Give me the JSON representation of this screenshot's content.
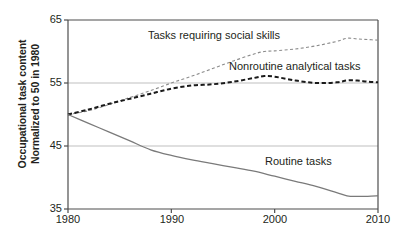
{
  "chart_data": {
    "type": "line",
    "title": "",
    "xlabel": "",
    "ylabel": "Occupational task content Normalized to 50 in 1980",
    "ylabel_lines": [
      "Occupational task content",
      "Normalized to 50 in 1980"
    ],
    "xlim": [
      1980,
      2010
    ],
    "ylim": [
      35,
      65
    ],
    "xticks": [
      1980,
      1990,
      2000,
      2010
    ],
    "xtick_labels": [
      "1980",
      "1990",
      "2000",
      "2010"
    ],
    "yticks": [
      35,
      45,
      55,
      65
    ],
    "ytick_labels": [
      "35",
      "45",
      "55",
      "65"
    ],
    "grid": "horizontal",
    "legend_position": "inline-annotations",
    "series": [
      {
        "name": "Tasks requiring social skills",
        "label": "Tasks requiring social skills",
        "style": "dashed",
        "color": "#8c8c8c",
        "x": [
          1980,
          1982,
          1984,
          1986,
          1988,
          1990,
          1992,
          1994,
          1996,
          1998,
          1999,
          2000,
          2002,
          2004,
          2006,
          2007,
          2008,
          2009,
          2010
        ],
        "values": [
          50.0,
          50.6,
          51.6,
          52.7,
          53.8,
          55.0,
          56.1,
          57.3,
          58.5,
          59.6,
          60.0,
          60.1,
          60.4,
          60.9,
          61.6,
          62.1,
          62.0,
          61.9,
          61.8
        ]
      },
      {
        "name": "Nonroutine analytical tasks",
        "label": "Nonroutine analytical tasks",
        "style": "dashed-bold",
        "color": "#1a1a1a",
        "x": [
          1980,
          1982,
          1984,
          1986,
          1988,
          1990,
          1992,
          1994,
          1996,
          1998,
          1999,
          2000,
          2002,
          2004,
          2006,
          2007,
          2008,
          2009,
          2010
        ],
        "values": [
          50.0,
          50.8,
          51.7,
          52.5,
          53.3,
          54.1,
          54.6,
          54.8,
          55.2,
          55.8,
          56.1,
          56.0,
          55.4,
          55.0,
          55.1,
          55.4,
          55.4,
          55.2,
          55.1
        ]
      },
      {
        "name": "Routine tasks",
        "label": "Routine tasks",
        "style": "solid",
        "color": "#7a7a7a",
        "x": [
          1980,
          1982,
          1984,
          1986,
          1988,
          1990,
          1992,
          1994,
          1996,
          1998,
          2000,
          2002,
          2004,
          2006,
          2007,
          2008,
          2009,
          2010
        ],
        "values": [
          50.0,
          48.6,
          47.2,
          45.8,
          44.4,
          43.5,
          42.8,
          42.2,
          41.6,
          41.0,
          40.2,
          39.4,
          38.6,
          37.6,
          37.1,
          37.0,
          37.0,
          37.1
        ]
      }
    ],
    "colors": {
      "axis": "#4d4d4d",
      "grid": "#bfbfbf",
      "social_skills": "#8c8c8c",
      "nonroutine_analytical": "#1a1a1a",
      "routine": "#7a7a7a",
      "text": "#231f20",
      "background": "#ffffff"
    }
  }
}
